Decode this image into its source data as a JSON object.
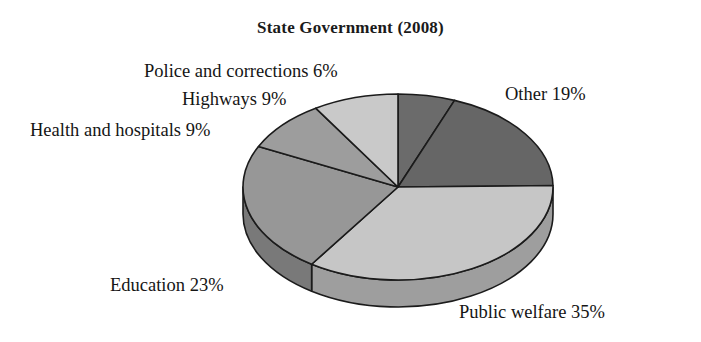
{
  "chart_data": {
    "type": "pie",
    "title": "State Government (2008)",
    "xlabel": "",
    "ylabel": "",
    "legend_position": "none",
    "grid": false,
    "three_d": true,
    "categories": [
      "Police and corrections",
      "Other",
      "Public welfare",
      "Education",
      "Health and hospitals",
      "Highways"
    ],
    "values": [
      6,
      19,
      35,
      23,
      9,
      9
    ],
    "unit": "%",
    "slices": [
      {
        "label": "Police and corrections",
        "value": 6,
        "display": "Police and corrections 6%",
        "color": "#6b6b6b",
        "side_color": "#555555"
      },
      {
        "label": "Other",
        "value": 19,
        "display": "Other 19%",
        "color": "#666666",
        "side_color": "#515151"
      },
      {
        "label": "Public welfare",
        "value": 35,
        "display": "Public welfare 35%",
        "color": "#c6c6c6",
        "side_color": "#9e9e9e"
      },
      {
        "label": "Education",
        "value": 23,
        "display": "Education 23%",
        "color": "#979797",
        "side_color": "#797979"
      },
      {
        "label": "Health and hospitals",
        "value": 9,
        "display": "Health and hospitals 9%",
        "color": "#9d9d9d",
        "side_color": "#7d7d7d"
      },
      {
        "label": "Highways",
        "value": 9,
        "display": "Highways 9%",
        "color": "#c9c9c9",
        "side_color": "#a1a1a1"
      }
    ],
    "annotations": [
      "Police and corrections 6%",
      "Highways 9%",
      "Health and hospitals 9%",
      "Other 19%",
      "Education 23%",
      "Public welfare 35%"
    ]
  },
  "labels": {
    "police": "Police and corrections 6%",
    "highways": "Highways 9%",
    "health": "Health and hospitals 9%",
    "other": "Other 19%",
    "education": "Education 23%",
    "public_welfare": "Public welfare 35%"
  },
  "colors": {
    "background": "#ffffff",
    "outline": "#1b1b1b",
    "text": "#151515",
    "dark_gray": "#666666",
    "medium_gray": "#979797",
    "light_gray": "#c6c6c6"
  }
}
